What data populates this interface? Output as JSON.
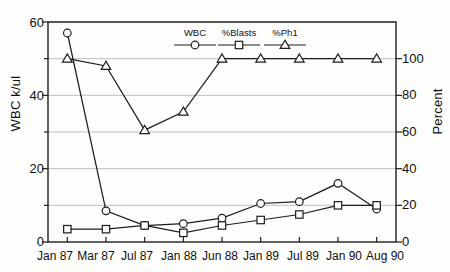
{
  "chart_data": {
    "type": "line",
    "title": "",
    "xlabel": "",
    "ylabel": "WBC k/ul",
    "y2label": "Percent",
    "categories": [
      "Jan 87",
      "Mar 87",
      "Jul 87",
      "Jan 88",
      "Jun 88",
      "Jan 89",
      "Jul 89",
      "Jan 90",
      "Aug 90"
    ],
    "ylim": [
      0,
      60
    ],
    "yticks": [
      0,
      20,
      40,
      60
    ],
    "y2lim": [
      0,
      120
    ],
    "y2ticks": [
      0,
      20,
      40,
      60,
      80,
      100
    ],
    "grid": true,
    "legend_position": "top-center",
    "series": [
      {
        "name": "WBC",
        "axis": "left",
        "marker": "circle",
        "values": [
          57,
          8.5,
          4.5,
          5,
          6.5,
          10.5,
          11,
          16,
          9
        ]
      },
      {
        "name": "%Blasts",
        "axis": "right",
        "marker": "square",
        "values": [
          7,
          7,
          9,
          5,
          9,
          12,
          15,
          20,
          20
        ]
      },
      {
        "name": "%Ph1",
        "axis": "right",
        "marker": "triangle",
        "values": [
          100,
          96,
          61,
          71,
          100,
          100,
          100,
          100,
          100
        ]
      }
    ]
  },
  "axes": {
    "left_title": "WBC k/ul",
    "right_title": "Percent",
    "left_ticks": [
      "60",
      "40",
      "20",
      "0"
    ],
    "right_ticks": [
      "100",
      "80",
      "60",
      "40",
      "20",
      "0"
    ],
    "x_ticks": [
      "Jan 87",
      "Mar 87",
      "Jul 87",
      "Jan 88",
      "Jun 88",
      "Jan 89",
      "Jul 89",
      "Jan 90",
      "Aug 90"
    ]
  },
  "legend": {
    "items": [
      {
        "label": "WBC",
        "marker": "circle"
      },
      {
        "label": "%Blasts",
        "marker": "square"
      },
      {
        "label": "%Ph1",
        "marker": "triangle"
      }
    ]
  },
  "colors": {
    "ink": "#1d1d1d",
    "grid": "#b9b9b9",
    "background": "#fdfdfc",
    "marker_fill": "#ffffff"
  }
}
